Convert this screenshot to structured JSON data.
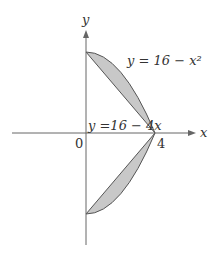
{
  "figure": {
    "axes": {
      "x_label": "x",
      "y_label": "y",
      "origin_label": "0",
      "x_tick_label": "4"
    },
    "curves": [
      {
        "label": "y = 16 − x²",
        "type": "parabola"
      },
      {
        "label": "y =16 − 4x",
        "type": "line"
      }
    ],
    "colors": {
      "fill": "#c8c8c8",
      "stroke": "#555555",
      "axis": "#666666"
    },
    "regions": [
      "upper region between y=16-x^2 and y=16-4x for 0<=x<=4",
      "mirrored lower region"
    ]
  }
}
